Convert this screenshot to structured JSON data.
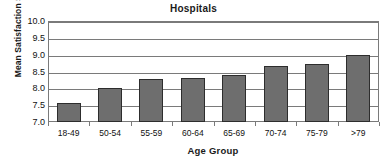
{
  "chart_data": {
    "type": "bar",
    "title": "Hospitals",
    "xlabel": "Age Group",
    "ylabel": "Mean Satisfaction Score",
    "categories": [
      "18-49",
      "50-54",
      "55-59",
      "60-64",
      "65-69",
      "70-74",
      "75-79",
      ">79"
    ],
    "values": [
      7.55,
      8.0,
      8.27,
      8.3,
      8.4,
      8.65,
      8.72,
      9.0
    ],
    "ylim": [
      7.0,
      10.0
    ],
    "yticks": [
      "10.0",
      "9.5",
      "9.0",
      "8.5",
      "8.0",
      "7.5",
      "7.0"
    ],
    "ytick_values": [
      10.0,
      9.5,
      9.0,
      8.5,
      8.0,
      7.5,
      7.0
    ],
    "grid": true,
    "legend": false,
    "bar_color": "#6e6e6e",
    "bar_border_color": "#2d2d2d",
    "axis_color": "#7a7a7a",
    "text_color": "#111111"
  }
}
